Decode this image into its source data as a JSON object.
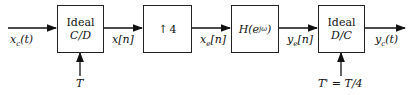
{
  "blocks": {
    "cd": {
      "line1": "Ideal",
      "line2": "C/D"
    },
    "upsampler": {
      "arrow": "↑",
      "factor": "4"
    },
    "filter": {
      "label": "H(e",
      "sup": "jω",
      "close": ")"
    },
    "dc": {
      "line1": "Ideal",
      "line2": "D/C"
    }
  },
  "signals": {
    "input": "xc(t)",
    "x": "x[n]",
    "xe": "xe[n]",
    "ye": "ye[n]",
    "output": "yc(t)"
  },
  "signal_parts": {
    "input": {
      "base": "x",
      "sub": "c",
      "arg": "(t)"
    },
    "x": {
      "base": "x[n]"
    },
    "xe": {
      "base": "x",
      "sub": "e",
      "arg": "[n]"
    },
    "ye": {
      "base": "y",
      "sub": "e",
      "arg": "[n]"
    },
    "output": {
      "base": "y",
      "sub": "c",
      "arg": "(t)"
    }
  },
  "controls": {
    "cd_period": "T",
    "dc_period": "T' = T/4"
  }
}
